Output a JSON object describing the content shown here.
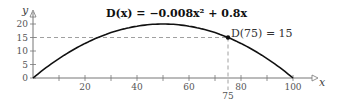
{
  "chart_data": {
    "type": "line",
    "title": "D(x) = −0.008x² + 0.8x",
    "xlabel": "x",
    "ylabel": "y",
    "xlim": [
      0,
      100
    ],
    "ylim": [
      0,
      22
    ],
    "x_ticks": [
      20,
      40,
      60,
      80,
      100
    ],
    "x_minor_ticks": [
      10,
      30,
      50,
      70,
      90
    ],
    "y_ticks": [
      0,
      5,
      10,
      15,
      20
    ],
    "grid": false,
    "series": [
      {
        "name": "D(x)",
        "x": [
          0,
          10,
          20,
          30,
          40,
          50,
          60,
          70,
          75,
          80,
          90,
          100
        ],
        "values": [
          0,
          7.2,
          12.8,
          16.8,
          19.2,
          20,
          19.2,
          16.8,
          15,
          12.8,
          7.2,
          0
        ]
      }
    ],
    "annotations": [
      {
        "text": "D(75) = 15",
        "x": 75,
        "y": 15,
        "marker": "point",
        "guides": "dashed"
      },
      {
        "text": "75",
        "x": 75,
        "y": 0,
        "position": "below-axis"
      }
    ]
  },
  "labels": {
    "title_lhs": "D(x) = ",
    "title": "D(x) = −0.008x² + 0.8x",
    "y_axis": "y",
    "x_axis": "x",
    "point_label": "D(75) = 15",
    "x75": "75",
    "x_ticks": [
      "20",
      "40",
      "60",
      "80",
      "100"
    ],
    "y_ticks": [
      "0",
      "5",
      "10",
      "15",
      "20"
    ]
  }
}
